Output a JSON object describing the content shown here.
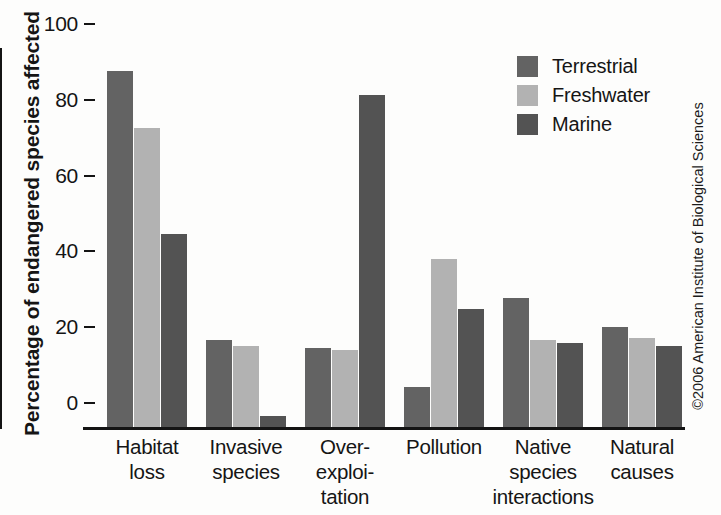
{
  "chart_data": {
    "type": "bar",
    "title": "",
    "xlabel": "",
    "ylabel": "Percentage of endangered species affected",
    "ylim": [
      0,
      100
    ],
    "yticks": [
      0,
      20,
      40,
      60,
      80,
      100
    ],
    "grid": false,
    "legend_position": "top-right",
    "categories": [
      "Habitat\nloss",
      "Invasive\nspecies",
      "Over-\nexploi-\ntation",
      "Pollution",
      "Native\nspecies\ninteractions",
      "Natural\ncauses"
    ],
    "category_lines": [
      [
        "Habitat",
        "loss"
      ],
      [
        "Invasive",
        "species"
      ],
      [
        "Over-",
        "exploi-",
        "tation"
      ],
      [
        "Pollution"
      ],
      [
        "Native",
        "species",
        "interactions"
      ],
      [
        "Natural",
        "causes"
      ]
    ],
    "series": [
      {
        "name": "Terrestrial",
        "color": "#636363",
        "values": [
          94,
          23,
          20.8,
          10.5,
          34,
          26.5
        ]
      },
      {
        "name": "Freshwater",
        "color": "#b2b2b2",
        "values": [
          79,
          21.4,
          20.3,
          44.2,
          23,
          23.5
        ]
      },
      {
        "name": "Marine",
        "color": "#535353",
        "values": [
          51,
          2.8,
          87.7,
          31.2,
          22.2,
          21.5
        ]
      }
    ]
  },
  "legend": {
    "items": [
      {
        "label": "Terrestrial",
        "color": "#636363"
      },
      {
        "label": "Freshwater",
        "color": "#b2b2b2"
      },
      {
        "label": "Marine",
        "color": "#535353"
      }
    ]
  },
  "copyright": "©2006 American Institute of Biological Sciences",
  "colors": {
    "axis": "#141414",
    "text": "#151515",
    "background": "#fdfdfc"
  }
}
